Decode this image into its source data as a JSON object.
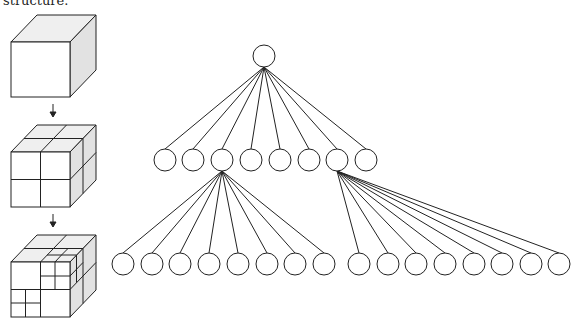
{
  "caption": "structure.",
  "colors": {
    "stroke": "#222222",
    "face_front": "#ffffff",
    "face_top": "#efefef",
    "face_side": "#e2e2e2"
  },
  "cubes": [
    {
      "label": "root-cube",
      "subdivision": "none"
    },
    {
      "label": "level-1-cube",
      "subdivision": "octants"
    },
    {
      "label": "level-2-cube",
      "subdivision": "partial-octants"
    }
  ],
  "tree": {
    "root": {
      "x": 264,
      "y": 56
    },
    "radius": 11,
    "level1": {
      "y": 160,
      "xs": [
        165,
        193,
        222,
        251,
        280,
        309,
        337,
        366
      ]
    },
    "level2_left": {
      "parent_index": 2,
      "y": 264,
      "xs": [
        123,
        152,
        180,
        209,
        238,
        267,
        295,
        324
      ]
    },
    "level2_right": {
      "parent_index": 6,
      "y": 264,
      "xs": [
        359,
        388,
        416,
        445,
        474,
        502,
        531,
        559
      ]
    }
  }
}
